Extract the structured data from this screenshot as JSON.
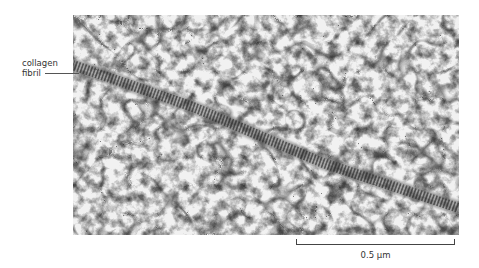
{
  "figure": {
    "annotation": {
      "line1": "collagen",
      "line2": "fibril"
    },
    "scale_bar": {
      "label": "0.5 µm"
    },
    "micrograph": {
      "description": "Electron micrograph of a banded collagen fibril crossing a proteoglycan network"
    }
  }
}
